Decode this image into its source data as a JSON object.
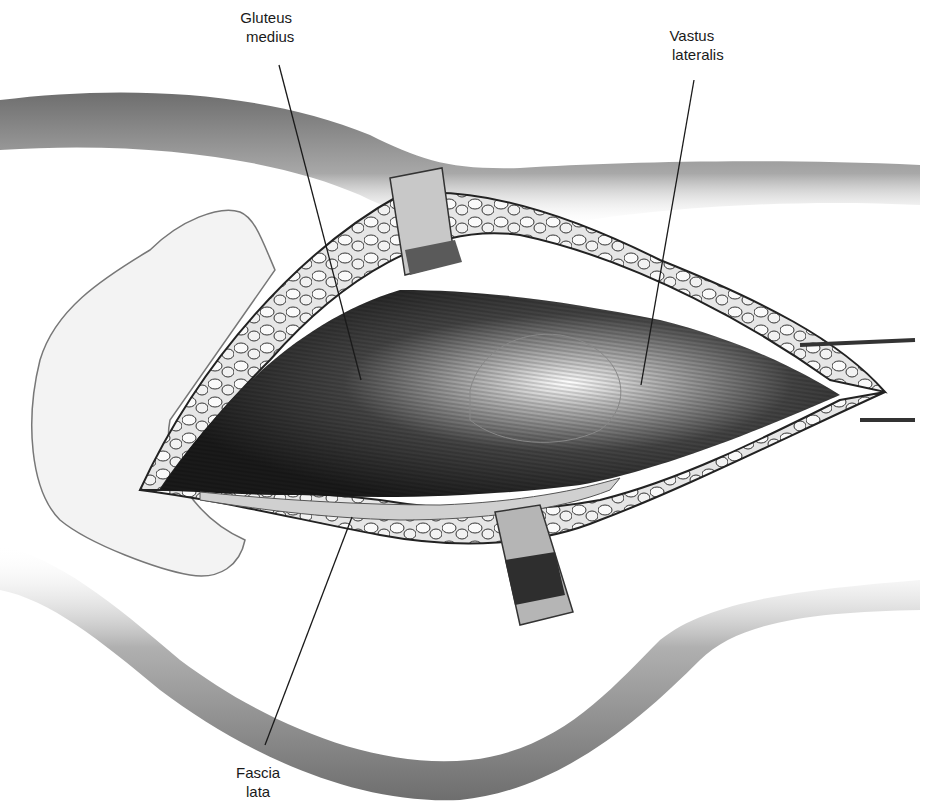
{
  "figure": {
    "type": "anatomical-illustration",
    "colors": {
      "background": "#ffffff",
      "ink": "#1a1a1a",
      "skin_shade": "#8a8a8a",
      "muscle_dark": "#2a2a2a"
    }
  },
  "labels": [
    {
      "id": "gluteus-medius",
      "line1": "Gluteus",
      "line2": "medius",
      "x": 238,
      "y": 8,
      "leader": {
        "x1": 279,
        "y1": 65,
        "x2": 361,
        "y2": 380
      }
    },
    {
      "id": "vastus-lateralis",
      "line1": "Vastus",
      "line2": "lateralis",
      "x": 655,
      "y": 26,
      "leader": {
        "x1": 694,
        "y1": 80,
        "x2": 641,
        "y2": 385
      }
    },
    {
      "id": "fascia-lata",
      "line1": "Fascia",
      "line2": "lata",
      "x": 236,
      "y": 763,
      "leader": {
        "x1": 352,
        "y1": 517,
        "x2": 265,
        "y2": 745
      }
    }
  ]
}
